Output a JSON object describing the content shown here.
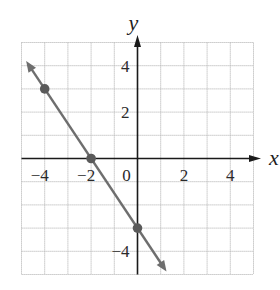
{
  "chart_data": {
    "type": "line",
    "title": "",
    "xlabel": "x",
    "ylabel": "y",
    "xlim": [
      -5,
      5
    ],
    "ylim": [
      -5,
      5
    ],
    "grid": true,
    "grid_step": 1,
    "x_tick_labels": [
      {
        "value": -4,
        "label": "−4"
      },
      {
        "value": -2,
        "label": "−2"
      },
      {
        "value": 0,
        "label": "0"
      },
      {
        "value": 2,
        "label": "2"
      },
      {
        "value": 4,
        "label": "4"
      }
    ],
    "y_tick_labels": [
      {
        "value": 4,
        "label": "4"
      },
      {
        "value": 2,
        "label": "2"
      },
      {
        "value": -4,
        "label": "−4"
      }
    ],
    "series": [
      {
        "name": "line",
        "equation": "y = -1.5x - 3",
        "slope": -1.5,
        "intercept": -3,
        "arrows": "both",
        "x_range": [
          -4.8,
          1.25
        ],
        "points": [
          {
            "x": -4,
            "y": 3
          },
          {
            "x": -2,
            "y": 0
          },
          {
            "x": 0,
            "y": -3
          }
        ]
      }
    ],
    "legend": null
  },
  "colors": {
    "grid": "#b8b8b8",
    "axis": "#1a1a1a",
    "line": "#6e6e6e",
    "point": "#5a5a5a",
    "text": "#2a2a2a"
  },
  "layout": {
    "origin_px": [
      137.5,
      158.5
    ],
    "unit_px": 23.2,
    "axis_extent": {
      "x_min": -5,
      "x_max": 5.15,
      "y_min": -5,
      "y_max": 5.15
    }
  }
}
